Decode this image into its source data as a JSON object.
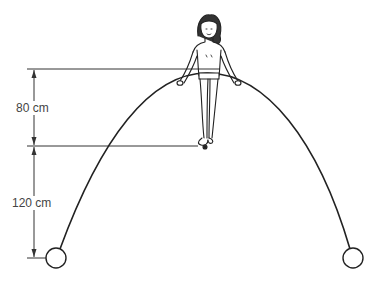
{
  "diagram": {
    "type": "physics-illustration",
    "dimensions": [
      {
        "id": "upper",
        "label": "80 cm",
        "from": "foot level",
        "to": "top reference line"
      },
      {
        "id": "lower",
        "label": "120 cm",
        "from": "pulley center level",
        "to": "foot level"
      }
    ],
    "elements": {
      "figure": "girl balancing on the arc, hands gripping the wire",
      "arc": "parabolic wire from left pulley to right pulley",
      "left_pulley": "circle at lower left",
      "right_pulley": "circle at lower right"
    },
    "colors": {
      "line": "#222222",
      "text": "#444444",
      "background": "#ffffff"
    }
  }
}
